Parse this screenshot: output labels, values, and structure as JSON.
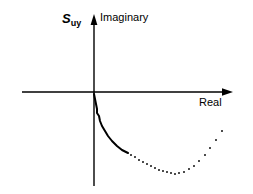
{
  "figure": {
    "background_color": "#ffffff",
    "ink_color": "#000000",
    "width": 253,
    "height": 194
  },
  "labels": {
    "quantity_symbol": "S",
    "quantity_subscript": "uy",
    "vertical_axis": "Imaginary",
    "horizontal_axis": "Real"
  },
  "axes": {
    "origin": {
      "x": 94,
      "y": 92
    },
    "vertical": {
      "name": "imaginary-axis",
      "x": 94,
      "y_top": 15,
      "y_bottom": 186,
      "arrow": "up",
      "arrow_tip": {
        "x": 94,
        "y": 15
      }
    },
    "horizontal": {
      "name": "real-axis",
      "y": 92,
      "x_left": 22,
      "x_right": 232,
      "arrow": "right",
      "arrow_tip": {
        "x": 232,
        "y": 92
      }
    }
  },
  "chart_data": {
    "type": "line",
    "title": "",
    "subtitle": "",
    "xlabel": "Real",
    "ylabel": "Imaginary",
    "annotations": [
      "S uy"
    ],
    "grid": false,
    "legend": null,
    "axis_tick_labels": {
      "x": [],
      "y": []
    },
    "xlim": [
      22,
      232
    ],
    "ylim": [
      186,
      15
    ],
    "note": "Nyquist-style locus in the complex plane, plotted in screen pixel coordinates (y increases downward). Solid segment then dotted segment.",
    "series": [
      {
        "name": "locus-solid",
        "style": "solid",
        "points": [
          {
            "x": 94,
            "y": 94
          },
          {
            "x": 95,
            "y": 99
          },
          {
            "x": 96,
            "y": 104
          },
          {
            "x": 97,
            "y": 109
          },
          {
            "x": 97,
            "y": 113
          },
          {
            "x": 99,
            "y": 116
          },
          {
            "x": 100,
            "y": 121
          },
          {
            "x": 102,
            "y": 126
          },
          {
            "x": 105,
            "y": 131
          },
          {
            "x": 108,
            "y": 136
          },
          {
            "x": 112,
            "y": 141
          },
          {
            "x": 117,
            "y": 146
          },
          {
            "x": 122,
            "y": 150
          },
          {
            "x": 128,
            "y": 153
          }
        ]
      },
      {
        "name": "locus-dotted",
        "style": "dotted",
        "points": [
          {
            "x": 131,
            "y": 155
          },
          {
            "x": 135,
            "y": 157
          },
          {
            "x": 139,
            "y": 160
          },
          {
            "x": 143,
            "y": 162
          },
          {
            "x": 147,
            "y": 164
          },
          {
            "x": 151,
            "y": 166
          },
          {
            "x": 155,
            "y": 168
          },
          {
            "x": 159,
            "y": 170
          },
          {
            "x": 163,
            "y": 171
          },
          {
            "x": 167,
            "y": 172
          },
          {
            "x": 171,
            "y": 173
          },
          {
            "x": 175,
            "y": 174
          },
          {
            "x": 179,
            "y": 173
          },
          {
            "x": 184,
            "y": 172
          },
          {
            "x": 189,
            "y": 169
          },
          {
            "x": 194,
            "y": 166
          },
          {
            "x": 199,
            "y": 161
          },
          {
            "x": 205,
            "y": 155
          },
          {
            "x": 210,
            "y": 148
          },
          {
            "x": 216,
            "y": 140
          },
          {
            "x": 222,
            "y": 131
          }
        ]
      }
    ]
  }
}
